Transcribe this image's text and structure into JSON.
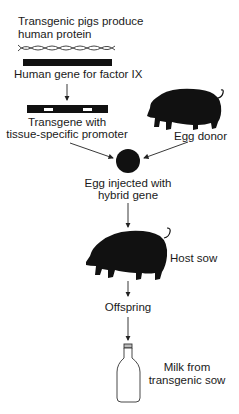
{
  "diagram": {
    "title_line1": "Transgenic pigs produce",
    "title_line2": "human protein",
    "gene_label": "Human gene for factor IX",
    "transgene_line1": "Transgene with",
    "transgene_line2": "tissue-specific promoter",
    "egg_donor_label": "Egg donor",
    "egg_line1": "Egg injected with",
    "egg_line2": "hybrid gene",
    "host_label": "Host sow",
    "offspring_label": "Offspring",
    "milk_line1": "Milk from",
    "milk_line2": "transgenic sow"
  },
  "icons": {
    "dna": "dna-helix-icon",
    "gene_bar": "gene-bar",
    "transgene_bar": "transgene-bar",
    "egg_donor": "pig-icon",
    "egg": "egg-cell-icon",
    "host_sow": "pig-icon",
    "bottle": "milk-bottle-icon"
  },
  "colors": {
    "ink": "#111111",
    "background": "#ffffff"
  }
}
